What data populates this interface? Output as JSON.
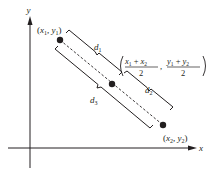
{
  "diagram": {
    "axes": {
      "x_label": "x",
      "y_label": "y"
    },
    "points": [
      {
        "id": "p1",
        "label_x": "x",
        "label_x_sub": "1",
        "label_y": "y",
        "label_y_sub": "1"
      },
      {
        "id": "midpoint",
        "label": "((x1 + x2)/2, (y1 + y2)/2)"
      },
      {
        "id": "p2",
        "label_x": "x",
        "label_x_sub": "2",
        "label_y": "y",
        "label_y_sub": "2"
      }
    ],
    "distances": [
      {
        "id": "d1",
        "label": "d",
        "sub": "1"
      },
      {
        "id": "d2",
        "label": "d",
        "sub": "2"
      },
      {
        "id": "d3",
        "label": "d",
        "sub": "3"
      }
    ],
    "midpoint_formula": {
      "num1": "x1 + x2",
      "num1_a": "x",
      "num1_a_sub": "1",
      "plus": "+",
      "num1_b": "x",
      "num1_b_sub": "2",
      "den1": "2",
      "num2_a": "y",
      "num2_a_sub": "1",
      "num2_b": "y",
      "num2_b_sub": "2",
      "den2": "2",
      "comma": ","
    },
    "colors": {
      "ink": "#231f20",
      "background": "#ffffff"
    }
  }
}
